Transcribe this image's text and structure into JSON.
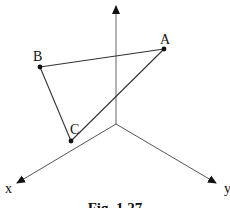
{
  "figure": {
    "caption": "Fig. 1.27",
    "axes": {
      "origin": [
        116,
        124
      ],
      "z_axis": {
        "label": "",
        "end": [
          116,
          6
        ]
      },
      "x_axis": {
        "label": "x",
        "end": [
          17,
          183
        ]
      },
      "y_axis": {
        "label": "y",
        "end": [
          216,
          183
        ]
      }
    },
    "points": [
      {
        "name": "A",
        "pos": [
          164,
          49
        ],
        "label_pos": [
          160,
          44
        ]
      },
      {
        "name": "B",
        "pos": [
          40,
          67
        ],
        "label_pos": [
          33,
          61
        ]
      },
      {
        "name": "C",
        "pos": [
          71,
          141
        ],
        "label_pos": [
          70,
          133
        ]
      }
    ],
    "edges": [
      [
        "A",
        "B"
      ],
      [
        "B",
        "C"
      ],
      [
        "C",
        "A"
      ]
    ],
    "colors": {
      "line": "#333333",
      "axis": "#555555",
      "point": "#111111",
      "background": "#ffffff"
    }
  }
}
